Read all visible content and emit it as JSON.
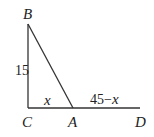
{
  "diagram": {
    "points": {
      "B": {
        "label": "B"
      },
      "C": {
        "label": "C"
      },
      "A": {
        "label": "A"
      },
      "D": {
        "label": "D"
      }
    },
    "side_labels": {
      "BC": "15",
      "CA": "x",
      "AD_num": "45−",
      "AD_var": "x"
    },
    "colors": {
      "line": "#333333",
      "text": "#222222"
    }
  }
}
